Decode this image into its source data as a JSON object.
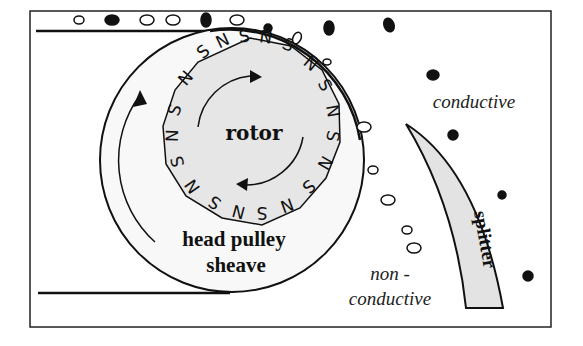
{
  "diagram": {
    "type": "eddy-current-separator",
    "labels": {
      "rotor": "rotor",
      "head_pulley_line1": "head pulley",
      "head_pulley_line2": "sheave",
      "conductive": "conductive",
      "non_conductive_line1": "non -",
      "non_conductive_line2": "conductive",
      "splitter": "splitter"
    },
    "rotor_poles": [
      "S",
      "N",
      "S",
      "N",
      "S",
      "N",
      "S",
      "N",
      "S",
      "N",
      "S",
      "N",
      "S",
      "N",
      "S",
      "N",
      "S",
      "N",
      "S",
      "N"
    ],
    "colors": {
      "line": "#111111",
      "rotor_fill": "#e6e6e6",
      "pulley_fill": "#f7f7f7",
      "splitter_fill": "#e3e3e3",
      "conductive_particle": "#111111",
      "non_conductive_particle": "#ffffff"
    },
    "legend": {
      "filled_particle": "conductive",
      "hollow_particle": "non-conductive"
    }
  }
}
